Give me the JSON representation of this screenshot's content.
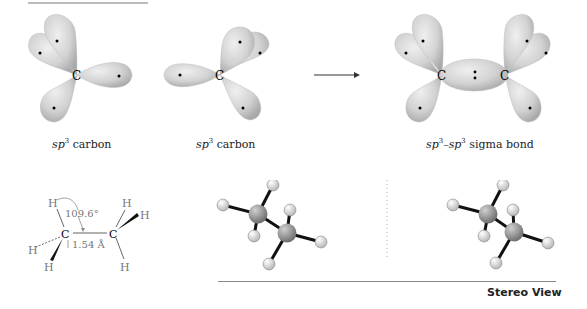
{
  "figure": {
    "orbitals": [
      {
        "id": "left",
        "label_prefix": "sp",
        "label_sup": "3",
        "label_suffix": " carbon",
        "atom": "C"
      },
      {
        "id": "middle",
        "label_prefix": "sp",
        "label_sup": "3",
        "label_suffix": " carbon",
        "atom": "C"
      },
      {
        "id": "result",
        "label_prefix": "sp",
        "label_sup": "3",
        "label_mid": "–sp",
        "label_sup2": "3",
        "label_suffix": " sigma bond",
        "atom": "C"
      }
    ],
    "structure": {
      "angle": "109.6°",
      "bond_length": "1.54 Å",
      "atoms": [
        "H",
        "C",
        "C",
        "H",
        "H",
        "H",
        "H",
        "H"
      ]
    },
    "stereo_label": "Stereo View",
    "colors": {
      "lobe": "#cfcfcf",
      "lobe_dark": "#a8a8a8",
      "carbon_ball": "#8e8e8e",
      "hydrogen_ball": "#e4e4e4",
      "line": "#888888"
    }
  }
}
